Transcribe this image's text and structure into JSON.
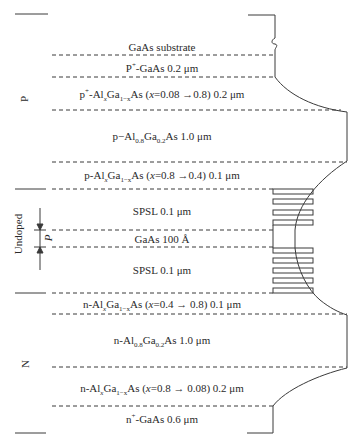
{
  "diagram": {
    "title": "",
    "layers": [
      {
        "id": "substrate",
        "prefix": "GaAs substrate",
        "text": "GaAs substrate"
      },
      {
        "id": "p-plus-gaas",
        "text": "P+-GaAs 0.2 μm",
        "parts": {
          "a": "P",
          "sup": "+",
          "b": "-GaAs 0.2 μm"
        }
      },
      {
        "id": "p-plus-graded",
        "text": "p+-AlxGa1−xAs (x=0.08 →0.8) 0.2 μm",
        "parts": {
          "a": "p",
          "sup": "+",
          "b": "-Al",
          "sub1": "x",
          "c": "Ga",
          "sub2": "1−x",
          "d": "As (",
          "var": "x",
          "e": "=0.08 →0.8) 0.2 μm"
        }
      },
      {
        "id": "p-cladding",
        "text": "p−Al0.8Ga0.2As 1.0 μm",
        "parts": {
          "a": "p−Al",
          "sub1": "0.8",
          "b": "Ga",
          "sub2": "0.2",
          "c": "As 1.0 μm"
        }
      },
      {
        "id": "p-graded",
        "text": "p-AlxGa1−xAs (x=0.8 →0.4) 0.1 μm",
        "parts": {
          "a": "p-Al",
          "sub1": "x",
          "b": "Ga",
          "sub2": "1−x",
          "c": "As (",
          "var": "x",
          "d": "=0.8 →0.4) 0.1 μm"
        }
      },
      {
        "id": "spsl-upper",
        "text": "SPSL 0.1 μm"
      },
      {
        "id": "gaas-well",
        "text": "GaAs 100 Å"
      },
      {
        "id": "spsl-lower",
        "text": "SPSL 0.1 μm"
      },
      {
        "id": "n-graded",
        "text": "n-AlxGa1−xAs (x=0.4 → 0.8) 0.1 μm",
        "parts": {
          "a": "n-Al",
          "sub1": "x",
          "b": "Ga",
          "sub2": "1−x",
          "c": "As (",
          "var": "x",
          "d": "=0.4 → 0.8) 0.1 μm"
        }
      },
      {
        "id": "n-cladding",
        "text": "n-Al0.8Ga0.2As 1.0 μm",
        "parts": {
          "a": "n-Al",
          "sub1": "0.8",
          "b": "Ga",
          "sub2": "0.2",
          "c": "As 1.0 μm"
        }
      },
      {
        "id": "n-graded-2",
        "text": "n-AlxGa1−xAs (x=0.8 → 0.08) 0.2 μm",
        "parts": {
          "a": "n-Al",
          "sub1": "x",
          "b": "Ga",
          "sub2": "1−x",
          "c": "As (",
          "var": "x",
          "d": "=0.8 → 0.08) 0.2 μm"
        }
      },
      {
        "id": "n-plus-gaas",
        "text": "n+-GaAs 0.6 μm",
        "parts": {
          "a": "n",
          "sup": "+",
          "b": "-GaAs 0.6 μm"
        }
      }
    ],
    "regions": {
      "p": "P",
      "undoped": "Undoped",
      "n": "N"
    },
    "dimension_label": "P",
    "colors": {
      "line": "#3a3a3a",
      "text": "#2a2a2a"
    }
  }
}
